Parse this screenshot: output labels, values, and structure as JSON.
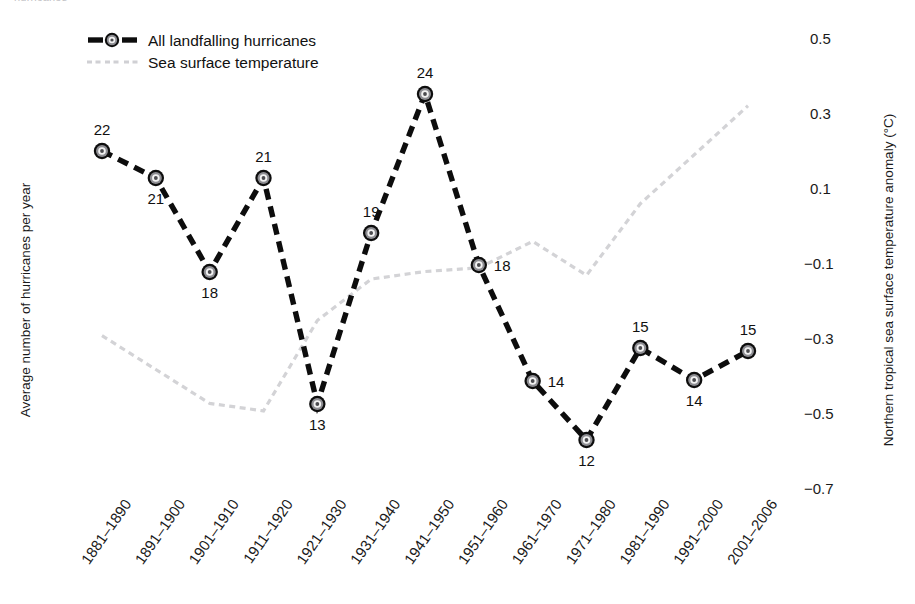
{
  "clipped_title": "hurricanes",
  "legend": {
    "position": "top-left",
    "items": [
      {
        "label": "All landfalling hurricanes",
        "marker": "dashed-line-with-target-marker",
        "color": "#0d0d0d"
      },
      {
        "label": "Sea surface temperature",
        "marker": "fine-dotted-line",
        "color": "#d0d0d4"
      }
    ]
  },
  "axes": {
    "left_title": "Average number of hurricanes per year",
    "right_title": "Northern tropical sea surface temperature anomaly (°C)",
    "right_ticks": [
      "0.5",
      "0.3",
      "0.1",
      "−0.1",
      "−0.3",
      "−0.5",
      "−0.7"
    ]
  },
  "chart_data": {
    "type": "line",
    "title": "",
    "xlabel": "",
    "ylabel": "Average number of hurricanes per year",
    "y2label": "Northern tropical sea surface temperature anomaly (°C)",
    "grid": false,
    "legend_position": "top-left",
    "categories": [
      "1881–1890",
      "1891–1900",
      "1901–1910",
      "1911–1920",
      "1921–1930",
      "1931–1940",
      "1941–1950",
      "1951–1960",
      "1961–1970",
      "1971–1980",
      "1981–1990",
      "1991–2000",
      "2001–2006"
    ],
    "series": [
      {
        "name": "All landfalling hurricanes",
        "axis": "left",
        "values": [
          22,
          21,
          18,
          21,
          13,
          19,
          24,
          18,
          14,
          12,
          15,
          14,
          15
        ],
        "point_labels": [
          "22",
          "21",
          "18",
          "21",
          "13",
          "19",
          "24",
          "18",
          "14",
          "12",
          "15",
          "14",
          "15"
        ]
      },
      {
        "name": "Sea surface temperature",
        "axis": "right",
        "values": [
          -0.29,
          -0.38,
          -0.47,
          -0.49,
          -0.25,
          -0.14,
          -0.12,
          -0.11,
          -0.04,
          -0.13,
          0.06,
          0.19,
          0.32
        ]
      }
    ],
    "y2lim": [
      -0.7,
      0.5
    ],
    "y2_ticks": [
      0.5,
      0.3,
      0.1,
      -0.1,
      -0.3,
      -0.5,
      -0.7
    ]
  },
  "layout": {
    "plot_left": 102,
    "plot_right": 748,
    "y2_top_px": 38,
    "y2_top_val": 0.5,
    "y2_bot_px": 490,
    "y2_bot_val": -0.7,
    "hurr_px": [
      151,
      178,
      272,
      178,
      404,
      233,
      94,
      265,
      381,
      440,
      348,
      380,
      351
    ]
  }
}
